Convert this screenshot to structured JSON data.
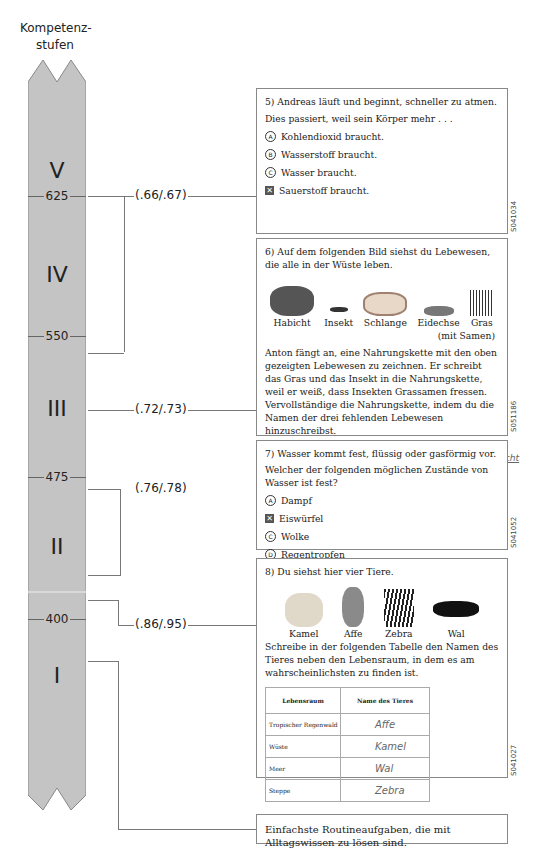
{
  "title": "Kompetenz-\nstufen",
  "title_lines": [
    "Kompetenz-",
    "stufen"
  ],
  "scale": {
    "levels": [
      "V",
      "IV",
      "III",
      "II",
      "I"
    ],
    "ticks": [
      "625",
      "550",
      "475",
      "400"
    ],
    "fill_color": "#c4c4c4"
  },
  "pvalues": [
    "(.66/.67)",
    "(.72/.73)",
    "(.76/.78)",
    "(.86/.95)"
  ],
  "q5": {
    "code": "S041034",
    "line1": "5) Andreas läuft und beginnt, schneller zu atmen.",
    "line2": "Dies passiert, weil sein Körper mehr . . .",
    "options": [
      {
        "mark": "A",
        "text": "Kohlendioxid braucht.",
        "selected": false
      },
      {
        "mark": "B",
        "text": "Wasserstoff braucht.",
        "selected": false
      },
      {
        "mark": "C",
        "text": "Wasser braucht.",
        "selected": false
      },
      {
        "mark": "D",
        "text": "Sauerstoff braucht.",
        "selected": true
      }
    ]
  },
  "q6": {
    "code": "S051186",
    "intro": "6) Auf dem folgenden Bild siehst du Lebewesen, die alle in der Wüste leben.",
    "organisms": [
      "Habicht",
      "Insekt",
      "Schlange",
      "Eidechse",
      "Gras",
      "(mit Samen)"
    ],
    "body": "Anton fängt an, eine Nahrungskette mit den oben gezeigten Lebewesen zu zeichnen. Er schreibt das Gras und das Insekt in die Nahrungskette, weil er weiß, dass Insekten Grassamen fressen. Vervollständige die Nahrungskette, indem du die Namen der drei fehlenden Lebewesen hinzuschreibst.",
    "chain": {
      "start1": "Gras",
      "start2": "(mit Samen)",
      "insect": "Insekt",
      "answers": [
        "Eidechse",
        "Schlange",
        "Habicht"
      ]
    }
  },
  "q7": {
    "code": "S041052",
    "line1": "7) Wasser kommt fest, flüssig oder gasförmig vor.",
    "line2": "Welcher der folgenden möglichen Zustände von Wasser ist fest?",
    "options": [
      {
        "mark": "A",
        "text": "Dampf",
        "selected": false
      },
      {
        "mark": "B",
        "text": "Eiswürfel",
        "selected": true
      },
      {
        "mark": "C",
        "text": "Wolke",
        "selected": false
      },
      {
        "mark": "D",
        "text": "Regentropfen",
        "selected": false
      }
    ]
  },
  "q8": {
    "code": "S041027",
    "intro": "8) Du siehst hier vier Tiere.",
    "animals": [
      "Kamel",
      "Affe",
      "Zebra",
      "Wal"
    ],
    "body": "Schreibe in der folgenden Tabelle den Namen des Tieres neben den Lebensraum, in dem es am wahrscheinlichsten zu finden ist.",
    "table": {
      "headers": [
        "Lebensraum",
        "Name des Tieres"
      ],
      "rows": [
        [
          "Tropischer Regenwald",
          "Affe"
        ],
        [
          "Wüste",
          "Kamel"
        ],
        [
          "Meer",
          "Wal"
        ],
        [
          "Steppe",
          "Zebra"
        ]
      ]
    }
  },
  "level1_description": "Einfachste Routineaufgaben, die mit Alltagswissen zu lösen sind."
}
